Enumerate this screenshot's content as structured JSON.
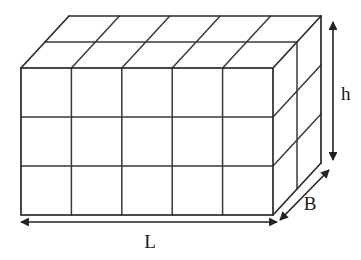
{
  "figure": {
    "type": "3d-cuboid-diagram",
    "background_color": "#ffffff",
    "line_color": "#2b2b2b",
    "grid_color": "#3a3a3a",
    "label_color": "#1a1a1a"
  },
  "labels": {
    "length": "L",
    "breadth": "B",
    "height": "h"
  },
  "geometry": {
    "front_face": {
      "top_left_x": 21,
      "top_left_y": 68,
      "width": 252,
      "height": 147,
      "columns": 5,
      "rows": 3,
      "column_step": 50.4,
      "row_step": 49
    },
    "depth_offset": {
      "dx": 48,
      "dy": -52
    },
    "depth_divisions": 2
  },
  "dimension_arrows": {
    "length_arrow": {
      "x1": 21,
      "y1": 222,
      "x2": 277,
      "y2": 222,
      "double_headed": true,
      "label_x": 150,
      "label_y": 245
    },
    "height_arrow": {
      "x1": 333,
      "y1": 22,
      "x2": 333,
      "y2": 160,
      "double_headed": true,
      "label_x": 341,
      "label_y": 99
    },
    "breadth_arrow": {
      "x1": 279,
      "y1": 219,
      "x2": 328,
      "y2": 171,
      "double_headed": true,
      "label_x": 312,
      "label_y": 208
    }
  }
}
